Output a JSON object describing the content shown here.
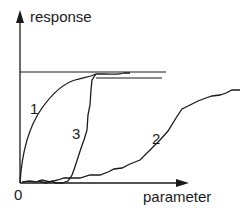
{
  "diagram": {
    "y_axis": {
      "label": "response"
    },
    "x_axis": {
      "label": "parameter"
    },
    "origin_label": "0",
    "curves": [
      {
        "id": "1",
        "label": "1",
        "description": "rapid concave rise, saturates at plateau"
      },
      {
        "id": "2",
        "label": "2",
        "description": "slow, delayed gradual rise"
      },
      {
        "id": "3",
        "label": "3",
        "description": "delayed then steep rise to plateau"
      }
    ],
    "plateau_lines": 2,
    "colors": {
      "stroke": "#1a1a1a",
      "background": "#ffffff"
    }
  }
}
